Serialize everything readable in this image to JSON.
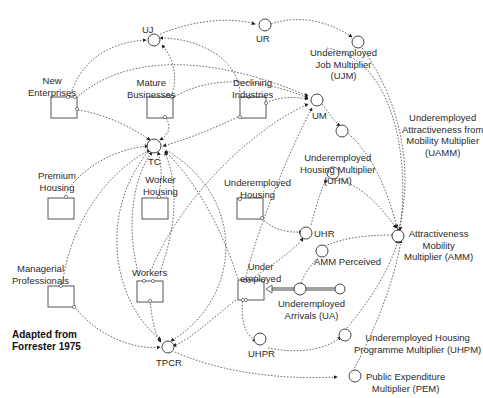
{
  "diagram": {
    "type": "stock-and-flow",
    "annotation": "Adapted from\nForrester 1975",
    "stocks": [
      {
        "id": "new_enterprises",
        "label": "New\nEnterprises"
      },
      {
        "id": "mature_businesses",
        "label": "Mature\nBusinesses"
      },
      {
        "id": "declining_industries",
        "label": "Declining\nIndustries"
      },
      {
        "id": "premium_housing",
        "label": "Premium\nHousing"
      },
      {
        "id": "worker_housing",
        "label": "Worker\nHousing"
      },
      {
        "id": "underemployed_housing",
        "label": "Underemployed\nHousing"
      },
      {
        "id": "managerial_professionals",
        "label": "Managerial\nProfessionals"
      },
      {
        "id": "workers",
        "label": "Workers"
      },
      {
        "id": "underemployed",
        "label": "Under\nemployed"
      }
    ],
    "auxiliaries": [
      {
        "id": "uj",
        "label": "UJ"
      },
      {
        "id": "ur",
        "label": "UR"
      },
      {
        "id": "ujm",
        "label": "Underemployed\nJob Multiplier\n(UJM)"
      },
      {
        "id": "um",
        "label": "UM"
      },
      {
        "id": "uamm",
        "label": "Underemployed\nAttractiveness from\nMobility Multiplier\n(UAMM)"
      },
      {
        "id": "tc",
        "label": "TC"
      },
      {
        "id": "uhm",
        "label": "Underemployed\nHousing Multiplier\n(UHM)"
      },
      {
        "id": "uhr",
        "label": "UHR"
      },
      {
        "id": "amm",
        "label": "Attractiveness\nMobility\nMultiplier (AMM)"
      },
      {
        "id": "amm_perceived",
        "label": "AMM Perceived"
      },
      {
        "id": "ua",
        "label": "Underemployed\nArrivals (UA)"
      },
      {
        "id": "uhpr",
        "label": "UHPR"
      },
      {
        "id": "uhpm",
        "label": "Underemployed Housing\nProgramme Multiplier (UHPM)"
      },
      {
        "id": "tpcr",
        "label": "TPCR"
      },
      {
        "id": "pem",
        "label": "Public Expenditure\nMultiplier (PEM)"
      }
    ],
    "links": [
      [
        "new_enterprises",
        "uj"
      ],
      [
        "mature_businesses",
        "uj"
      ],
      [
        "declining_industries",
        "uj"
      ],
      [
        "uj",
        "ur"
      ],
      [
        "ur",
        "ujm"
      ],
      [
        "ujm",
        "amm"
      ],
      [
        "new_enterprises",
        "um"
      ],
      [
        "mature_businesses",
        "um"
      ],
      [
        "declining_industries",
        "um"
      ],
      [
        "new_enterprises",
        "tc"
      ],
      [
        "mature_businesses",
        "tc"
      ],
      [
        "declining_industries",
        "tc"
      ],
      [
        "premium_housing",
        "tc"
      ],
      [
        "worker_housing",
        "tc"
      ],
      [
        "managerial_professionals",
        "tc"
      ],
      [
        "workers",
        "tc"
      ],
      [
        "underemployed",
        "tc"
      ],
      [
        "underemployed_housing",
        "tc"
      ],
      [
        "workers",
        "um"
      ],
      [
        "underemployed",
        "um"
      ],
      [
        "um",
        "uhm"
      ],
      [
        "uhm",
        "amm"
      ],
      [
        "um",
        "uamm"
      ],
      [
        "uamm",
        "amm"
      ],
      [
        "underemployed_housing",
        "uhr"
      ],
      [
        "underemployed",
        "uhr"
      ],
      [
        "uhr",
        "uhm"
      ],
      [
        "amm",
        "amm_perceived"
      ],
      [
        "amm_perceived",
        "ua"
      ],
      [
        "ua",
        "underemployed"
      ],
      [
        "underemployed",
        "uhpr"
      ],
      [
        "uhpr",
        "uhpm"
      ],
      [
        "uhpm",
        "amm"
      ],
      [
        "managerial_professionals",
        "tpcr"
      ],
      [
        "workers",
        "tpcr"
      ],
      [
        "underemployed",
        "tpcr"
      ],
      [
        "tc",
        "tpcr"
      ],
      [
        "tpcr",
        "pem"
      ],
      [
        "pem",
        "amm"
      ]
    ]
  }
}
